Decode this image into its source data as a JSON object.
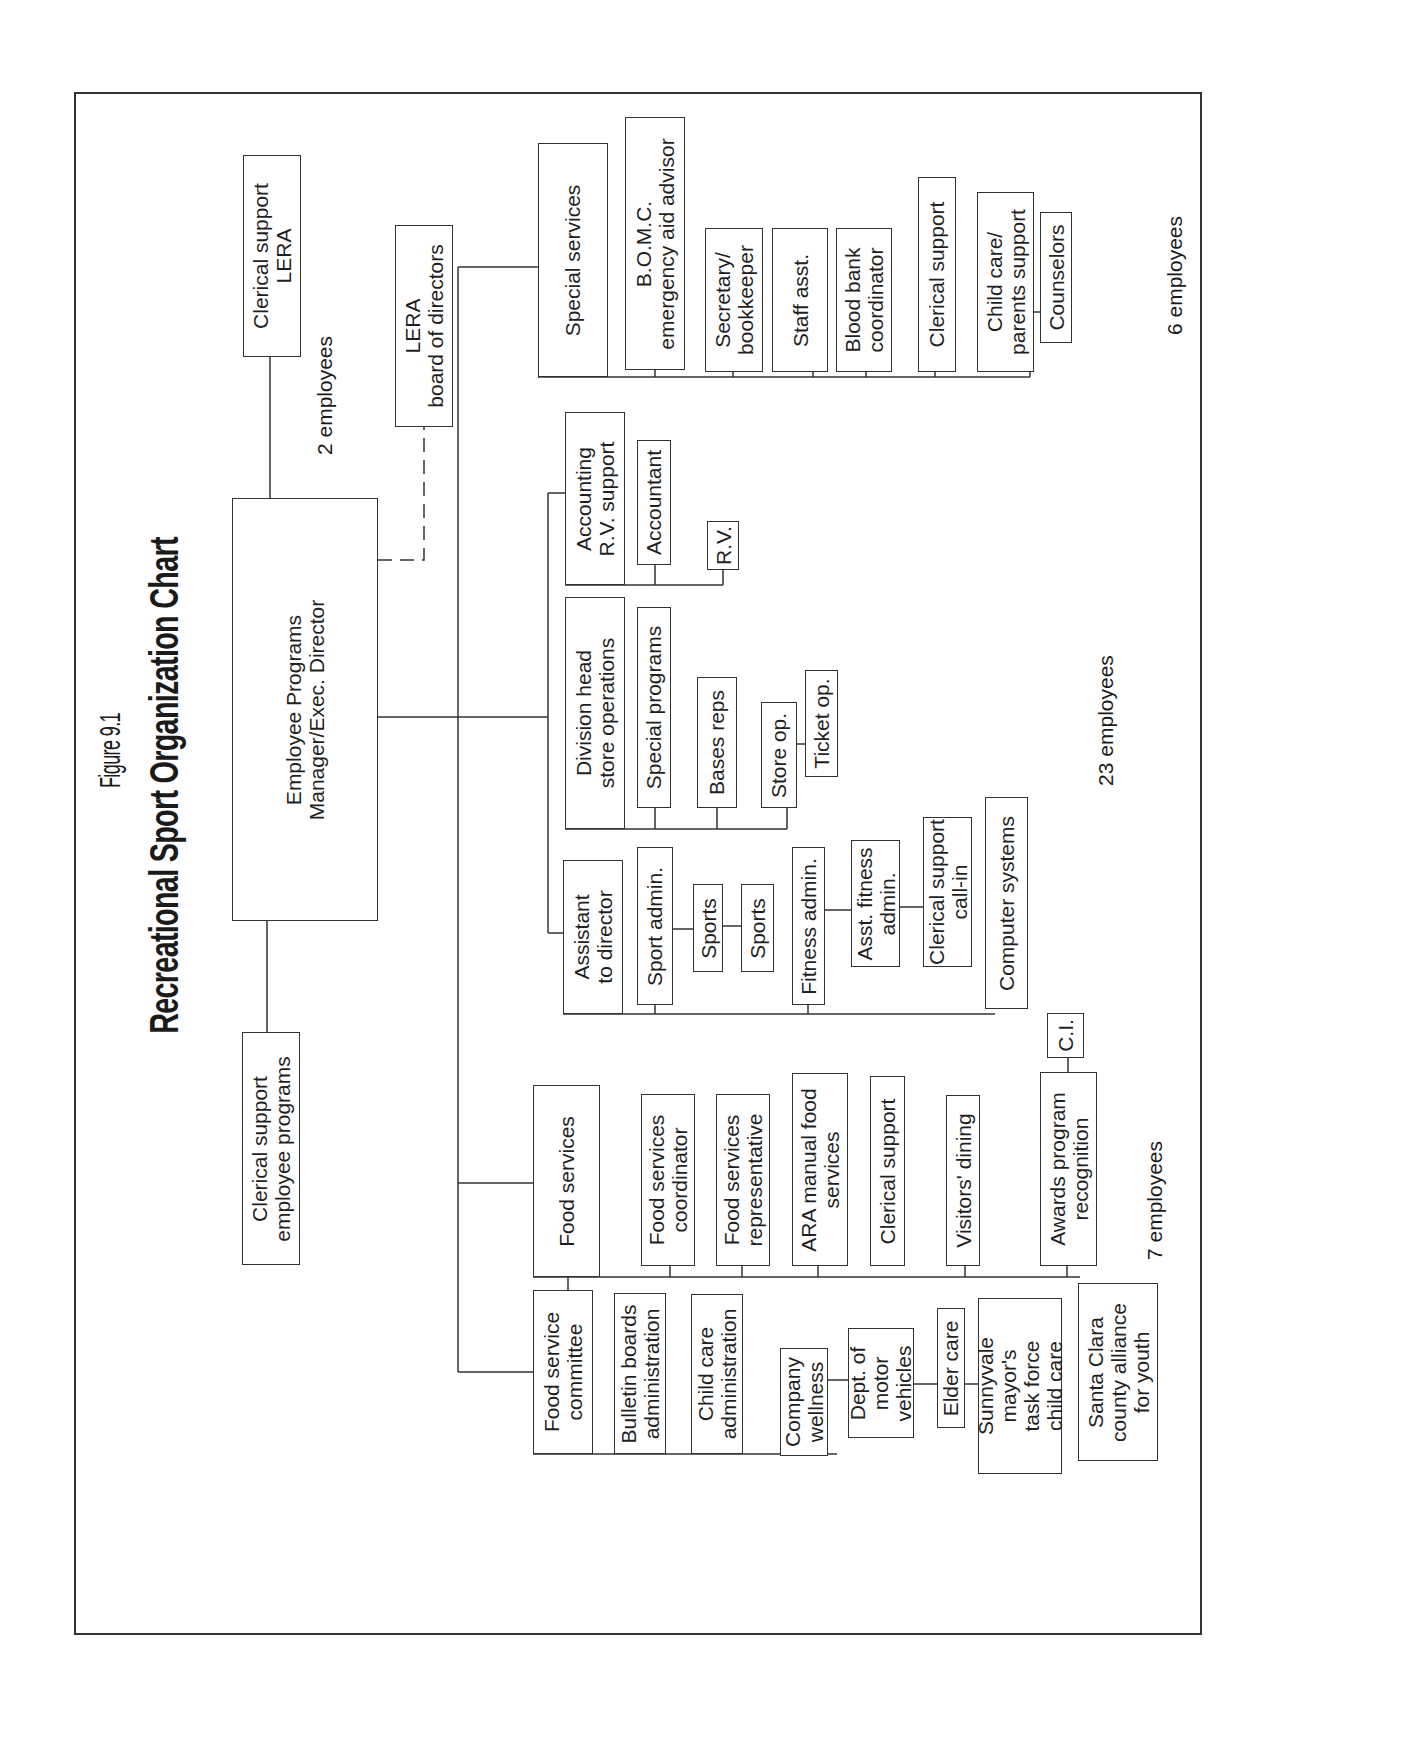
{
  "figure_label": "Figure 9.1",
  "title": "Recreational Sport Organization Chart",
  "root": "Employee Programs\nManager/Exec. Director",
  "staff": {
    "clerical_lera": "Clerical support\nLERA",
    "clerical_employee_programs": "Clerical support\nemployee programs",
    "lera_board": "LERA\nboard of directors"
  },
  "counts": {
    "staff": "2 employees",
    "special_services": "6 employees",
    "operations": "23 employees",
    "food_services": "7 employees"
  },
  "special_services": {
    "head": "Special services",
    "items": [
      "B.O.M.C.\nemergency aid advisor",
      "Secretary/\nbookkeeper",
      "Staff asst.",
      "Blood bank\ncoordinator",
      "Clerical support",
      "Child care/\nparents support",
      "Counselors"
    ]
  },
  "accounting": {
    "head": "Accounting\nR.V. support",
    "items": [
      "Accountant",
      "R.V."
    ]
  },
  "store_operations": {
    "head": "Division head\nstore operations",
    "items": [
      "Special programs",
      "Bases reps",
      "Store op.",
      "Ticket op."
    ]
  },
  "assistant_director": {
    "head": "Assistant\nto director",
    "items": [
      "Sport admin.",
      "Sports",
      "Sports",
      "Fitness admin.",
      "Asst. fitness\nadmin.",
      "Clerical support\ncall-in",
      "Computer systems"
    ]
  },
  "food_services": {
    "head": "Food services",
    "items": [
      "Food services\ncoordinator",
      "Food services\nrepresentative",
      "ARA manual food\nservices",
      "Clerical support",
      "Visitors' dining",
      "Awards program\nrecognition",
      "C.I."
    ]
  },
  "committee": {
    "head": "Food service\ncommittee",
    "items": [
      "Bulletin boards\nadministration",
      "Child care\nadministration",
      "Company\nwellness",
      "Dept. of\nmotor\nvehicles",
      "Elder care",
      "Sunnyvale\nmayor's\ntask force\nchild care",
      "Santa Clara\ncounty alliance\nfor youth"
    ]
  },
  "colors": {
    "line": "#333333",
    "text": "#1f1f1f",
    "background": "#ffffff"
  }
}
